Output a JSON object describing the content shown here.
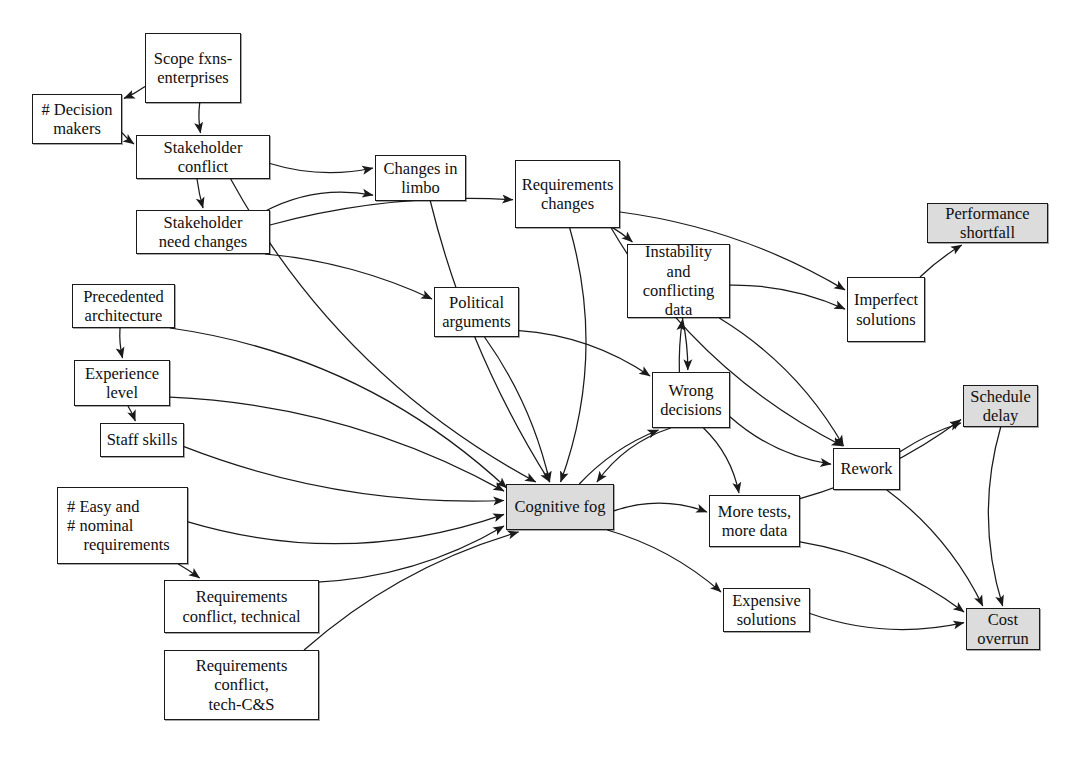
{
  "diagram": {
    "background_color": "#ffffff",
    "line_color": "#1a1a1a",
    "shaded_fill": "#dcdcdc",
    "node_fill": "#ffffff"
  },
  "nodes": [
    {
      "id": "scope",
      "label": "Scope fxns-\nenterprises",
      "x": 145,
      "y": 33,
      "w": 96,
      "h": 70,
      "shaded": false
    },
    {
      "id": "decision",
      "label": "# Decision\nmakers",
      "x": 32,
      "y": 94,
      "w": 90,
      "h": 50,
      "shaded": false
    },
    {
      "id": "stakeconf",
      "label": "Stakeholder\nconflict",
      "x": 136,
      "y": 135,
      "w": 134,
      "h": 44,
      "shaded": false
    },
    {
      "id": "stakeneed",
      "label": "Stakeholder\nneed changes",
      "x": 136,
      "y": 210,
      "w": 134,
      "h": 44,
      "shaded": false
    },
    {
      "id": "limbo",
      "label": "Changes in\nlimbo",
      "x": 375,
      "y": 155,
      "w": 91,
      "h": 46,
      "shaded": false
    },
    {
      "id": "reqchanges",
      "label": "Requirements\nchanges",
      "x": 515,
      "y": 160,
      "w": 105,
      "h": 68,
      "shaded": false
    },
    {
      "id": "instability",
      "label": "Instability and\nconflicting\ndata",
      "x": 627,
      "y": 244,
      "w": 103,
      "h": 74,
      "shaded": false
    },
    {
      "id": "imperfect",
      "label": "Imperfect\nsolutions",
      "x": 847,
      "y": 277,
      "w": 78,
      "h": 65,
      "shaded": false
    },
    {
      "id": "perfshort",
      "label": "Performance\nshortfall",
      "x": 927,
      "y": 203,
      "w": 121,
      "h": 40,
      "shaded": true
    },
    {
      "id": "political",
      "label": "Political\narguments",
      "x": 434,
      "y": 287,
      "w": 85,
      "h": 50,
      "shaded": false
    },
    {
      "id": "precedent",
      "label": "Precedented\narchitecture",
      "x": 72,
      "y": 284,
      "w": 103,
      "h": 44,
      "shaded": false
    },
    {
      "id": "experience",
      "label": "Experience\nlevel",
      "x": 74,
      "y": 360,
      "w": 96,
      "h": 46,
      "shaded": false
    },
    {
      "id": "staffskills",
      "label": "Staff skills",
      "x": 100,
      "y": 423,
      "w": 84,
      "h": 34,
      "shaded": false
    },
    {
      "id": "easynominal",
      "label": "# Easy and\n# nominal\n    requirements",
      "x": 57,
      "y": 487,
      "w": 131,
      "h": 77,
      "shaded": false
    },
    {
      "id": "reqtech",
      "label": "Requirements\nconflict, technical",
      "x": 164,
      "y": 580,
      "w": 155,
      "h": 53,
      "shaded": false
    },
    {
      "id": "reqcs",
      "label": "Requirements\nconflict,\ntech-C&S",
      "x": 164,
      "y": 650,
      "w": 155,
      "h": 70,
      "shaded": false
    },
    {
      "id": "wrongdec",
      "label": "Wrong\ndecisions",
      "x": 652,
      "y": 372,
      "w": 78,
      "h": 56,
      "shaded": false
    },
    {
      "id": "cogfog",
      "label": "Cognitive fog",
      "x": 506,
      "y": 484,
      "w": 108,
      "h": 46,
      "shaded": true
    },
    {
      "id": "moretests",
      "label": "More tests,\nmore data",
      "x": 709,
      "y": 495,
      "w": 91,
      "h": 52,
      "shaded": false
    },
    {
      "id": "expensive",
      "label": "Expensive\nsolutions",
      "x": 723,
      "y": 588,
      "w": 87,
      "h": 44,
      "shaded": false
    },
    {
      "id": "rework",
      "label": "Rework",
      "x": 833,
      "y": 448,
      "w": 67,
      "h": 42,
      "shaded": false
    },
    {
      "id": "scheduledelay",
      "label": "Schedule\ndelay",
      "x": 963,
      "y": 385,
      "w": 75,
      "h": 42,
      "shaded": true
    },
    {
      "id": "costoverrun",
      "label": "Cost\noverrun",
      "x": 966,
      "y": 608,
      "w": 74,
      "h": 42,
      "shaded": true
    }
  ],
  "edges": [
    {
      "from": "scope",
      "to": "decision"
    },
    {
      "from": "scope",
      "to": "stakeconf"
    },
    {
      "from": "decision",
      "to": "stakeconf"
    },
    {
      "from": "stakeconf",
      "to": "stakeneed"
    },
    {
      "from": "stakeconf",
      "to": "limbo"
    },
    {
      "from": "stakeconf",
      "to": "cogfog"
    },
    {
      "from": "stakeneed",
      "to": "limbo"
    },
    {
      "from": "stakeneed",
      "to": "reqchanges"
    },
    {
      "from": "stakeneed",
      "to": "political"
    },
    {
      "from": "limbo",
      "to": "cogfog"
    },
    {
      "from": "reqchanges",
      "to": "instability"
    },
    {
      "from": "reqchanges",
      "to": "imperfect"
    },
    {
      "from": "reqchanges",
      "to": "cogfog"
    },
    {
      "from": "reqchanges",
      "to": "rework"
    },
    {
      "from": "political",
      "to": "cogfog"
    },
    {
      "from": "political",
      "to": "wrongdec"
    },
    {
      "from": "instability",
      "to": "imperfect"
    },
    {
      "from": "instability",
      "to": "wrongdec"
    },
    {
      "from": "instability",
      "to": "rework"
    },
    {
      "from": "imperfect",
      "to": "perfshort"
    },
    {
      "from": "precedent",
      "to": "experience"
    },
    {
      "from": "precedent",
      "to": "cogfog"
    },
    {
      "from": "experience",
      "to": "staffskills"
    },
    {
      "from": "experience",
      "to": "cogfog"
    },
    {
      "from": "staffskills",
      "to": "cogfog"
    },
    {
      "from": "easynominal",
      "to": "cogfog"
    },
    {
      "from": "easynominal",
      "to": "reqtech"
    },
    {
      "from": "reqtech",
      "to": "cogfog"
    },
    {
      "from": "reqcs",
      "to": "cogfog"
    },
    {
      "from": "cogfog",
      "to": "wrongdec"
    },
    {
      "from": "cogfog",
      "to": "moretests"
    },
    {
      "from": "cogfog",
      "to": "expensive"
    },
    {
      "from": "wrongdec",
      "to": "instability"
    },
    {
      "from": "wrongdec",
      "to": "moretests"
    },
    {
      "from": "wrongdec",
      "to": "rework"
    },
    {
      "from": "wrongdec",
      "to": "cogfog"
    },
    {
      "from": "moretests",
      "to": "scheduledelay"
    },
    {
      "from": "moretests",
      "to": "costoverrun"
    },
    {
      "from": "expensive",
      "to": "costoverrun"
    },
    {
      "from": "rework",
      "to": "scheduledelay"
    },
    {
      "from": "rework",
      "to": "costoverrun"
    },
    {
      "from": "scheduledelay",
      "to": "costoverrun"
    }
  ]
}
